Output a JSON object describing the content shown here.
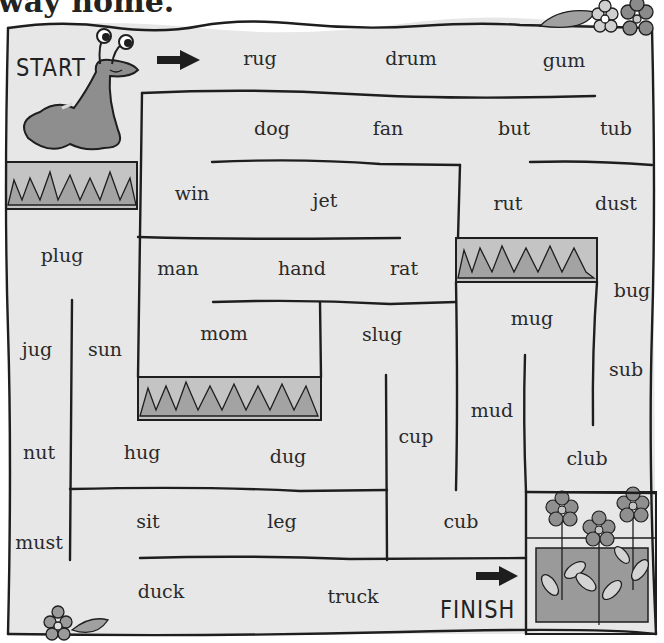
{
  "title": "way home.",
  "labels": {
    "start": "START",
    "finish": "FINISH"
  },
  "words": [
    {
      "text": "rug",
      "x": 260,
      "y": 58
    },
    {
      "text": "drum",
      "x": 411,
      "y": 58
    },
    {
      "text": "gum",
      "x": 564,
      "y": 60
    },
    {
      "text": "dog",
      "x": 272,
      "y": 128
    },
    {
      "text": "fan",
      "x": 388,
      "y": 128
    },
    {
      "text": "but",
      "x": 514,
      "y": 128
    },
    {
      "text": "tub",
      "x": 616,
      "y": 128
    },
    {
      "text": "win",
      "x": 192,
      "y": 193
    },
    {
      "text": "jet",
      "x": 325,
      "y": 200
    },
    {
      "text": "rut",
      "x": 508,
      "y": 203
    },
    {
      "text": "dust",
      "x": 616,
      "y": 203
    },
    {
      "text": "plug",
      "x": 62,
      "y": 255
    },
    {
      "text": "man",
      "x": 178,
      "y": 268
    },
    {
      "text": "hand",
      "x": 302,
      "y": 268
    },
    {
      "text": "rat",
      "x": 404,
      "y": 268
    },
    {
      "text": "bug",
      "x": 632,
      "y": 290
    },
    {
      "text": "mug",
      "x": 532,
      "y": 318
    },
    {
      "text": "mom",
      "x": 224,
      "y": 333
    },
    {
      "text": "slug",
      "x": 382,
      "y": 334
    },
    {
      "text": "jug",
      "x": 37,
      "y": 349
    },
    {
      "text": "sun",
      "x": 105,
      "y": 349
    },
    {
      "text": "sub",
      "x": 626,
      "y": 369
    },
    {
      "text": "mud",
      "x": 492,
      "y": 410
    },
    {
      "text": "cup",
      "x": 416,
      "y": 436
    },
    {
      "text": "nut",
      "x": 39,
      "y": 452
    },
    {
      "text": "hug",
      "x": 142,
      "y": 452
    },
    {
      "text": "dug",
      "x": 288,
      "y": 456
    },
    {
      "text": "club",
      "x": 587,
      "y": 458
    },
    {
      "text": "sit",
      "x": 148,
      "y": 521
    },
    {
      "text": "leg",
      "x": 282,
      "y": 521
    },
    {
      "text": "cub",
      "x": 461,
      "y": 521
    },
    {
      "text": "must",
      "x": 39,
      "y": 542
    },
    {
      "text": "duck",
      "x": 161,
      "y": 591
    },
    {
      "text": "truck",
      "x": 353,
      "y": 596
    }
  ],
  "colors": {
    "board": "#e7e7e7",
    "wall": "#1e1e1e",
    "grass_dark": "#a6a6a6",
    "grass_light": "#c9c9c9",
    "slug": "#8e8e8e"
  }
}
